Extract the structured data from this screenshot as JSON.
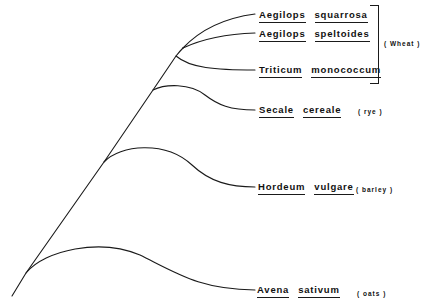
{
  "diagram": {
    "type": "phylogenetic-tree",
    "stroke_color": "#1a1a1a",
    "background": "#ffffff"
  },
  "taxa": [
    {
      "genus": "Aegilops",
      "species": "squarrosa",
      "common": ""
    },
    {
      "genus": "Aegilops",
      "species": "speltoides",
      "common": ""
    },
    {
      "genus": "Triticum",
      "species": "monococcum",
      "common": ""
    },
    {
      "genus": "Secale",
      "species": "cereale",
      "common": "( rye )"
    },
    {
      "genus": "Hordeum",
      "species": "vulgare",
      "common": "( barley )"
    },
    {
      "genus": "Avena",
      "species": "sativum",
      "common": "( oats )"
    }
  ],
  "groups": [
    {
      "label": "( Wheat )",
      "members": [
        "Aegilops squarrosa",
        "Aegilops speltoides",
        "Triticum monococcum"
      ]
    }
  ]
}
